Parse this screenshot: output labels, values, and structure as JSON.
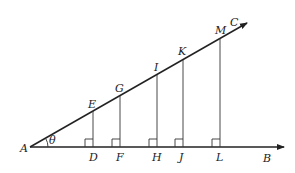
{
  "diagram": {
    "angle_label": "θ",
    "vertex": {
      "label": "A",
      "x": 30,
      "y": 147
    },
    "ray_ab_end": {
      "label": "B",
      "x": 285,
      "y": 147
    },
    "ray_ac_end": {
      "label": "C",
      "x": 248,
      "y": 22
    },
    "perpendiculars": [
      {
        "top": "E",
        "foot": "D",
        "x": 93,
        "ytop": 112
      },
      {
        "top": "G",
        "foot": "F",
        "x": 120,
        "ytop": 97
      },
      {
        "top": "I",
        "foot": "H",
        "x": 157,
        "ytop": 76
      },
      {
        "top": "K",
        "foot": "J",
        "x": 183,
        "ytop": 61
      },
      {
        "top": "M",
        "foot": "L",
        "x": 220,
        "ytop": 39
      }
    ],
    "labels": {
      "A": "A",
      "B": "B",
      "C": "C",
      "D": "D",
      "E": "E",
      "F": "F",
      "G": "G",
      "H": "H",
      "I": "I",
      "J": "J",
      "K": "K",
      "L": "L",
      "M": "M",
      "theta": "θ"
    }
  }
}
